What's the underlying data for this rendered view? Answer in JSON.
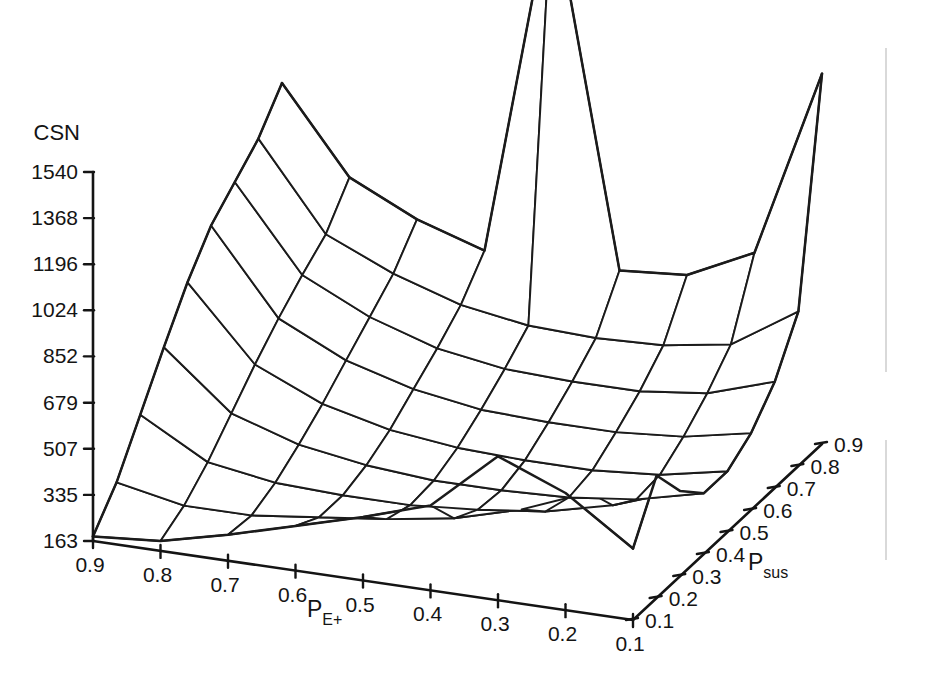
{
  "figure": {
    "kind": "3d-surface-wireframe",
    "background": "#ffffff",
    "line_color": "#1b1b1b"
  },
  "chart_data": {
    "type": "surface",
    "title": "",
    "zlabel": "CSN",
    "xlabel": "P",
    "xlabel_sub": "E+",
    "ylabel": "P",
    "ylabel_sub": "sus",
    "grid": false,
    "legend": "none",
    "x": [
      0.9,
      0.8,
      0.7,
      0.6,
      0.5,
      0.4,
      0.3,
      0.2,
      0.1
    ],
    "y": [
      0.1,
      0.2,
      0.3,
      0.4,
      0.5,
      0.6,
      0.7,
      0.8,
      0.9
    ],
    "x_tick_labels": [
      "0.9",
      "0.8",
      "0.7",
      "0.6",
      "0.5",
      "0.4",
      "0.3",
      "0.2",
      "0.1"
    ],
    "y_tick_labels": [
      "0.1",
      "0.2",
      "0.3",
      "0.4",
      "0.5",
      "0.6",
      "0.7",
      "0.8",
      "0.9"
    ],
    "z_tick_labels": [
      "163",
      "335",
      "507",
      "679",
      "852",
      "1024",
      "1196",
      "1368",
      "1540"
    ],
    "z_ticks": [
      163,
      335,
      507,
      679,
      852,
      1024,
      1196,
      1368,
      1540
    ],
    "zlim": [
      163,
      2100
    ],
    "z_axis_min": 163,
    "z_axis_max": 1540,
    "annotations": [
      "tall narrow spike near P_E+ = 0.6, P_sus = 0.9",
      "secondary spike near P_E+ = 0.3, P_sus = 0.2",
      "rising corner at P_E+ = 0.1, P_sus = 0.9",
      "rising corner at P_E+ = 0.9, P_sus = 0.9"
    ],
    "z": [
      [
        180,
        300,
        470,
        640,
        800,
        930,
        1010,
        1090,
        1215
      ],
      [
        200,
        250,
        330,
        430,
        530,
        620,
        700,
        770,
        900
      ],
      [
        260,
        250,
        290,
        350,
        420,
        500,
        580,
        660,
        780
      ],
      [
        330,
        280,
        280,
        310,
        360,
        430,
        500,
        580,
        700
      ],
      [
        400,
        310,
        280,
        290,
        330,
        390,
        460,
        540,
        2060
      ],
      [
        480,
        350,
        300,
        290,
        320,
        380,
        450,
        530,
        700
      ],
      [
        700,
        420,
        330,
        300,
        320,
        380,
        450,
        540,
        720
      ],
      [
        600,
        520,
        390,
        330,
        340,
        400,
        480,
        580,
        840
      ],
      [
        430,
        620,
        480,
        390,
        390,
        450,
        560,
        740,
        1545
      ]
    ]
  },
  "projection": {
    "origin_x": 93,
    "origin_y": 541,
    "x_axis_end_x": 633,
    "x_axis_end_y": 620,
    "y_axis_end_x": 822,
    "y_axis_end_y": 444,
    "z_top_y": 172,
    "z_bottom_y": 541
  },
  "z_axis": {
    "label": "CSN",
    "ticks": [
      {
        "label": "1540",
        "value": 1540
      },
      {
        "label": "1368",
        "value": 1368
      },
      {
        "label": "1196",
        "value": 1196
      },
      {
        "label": "1024",
        "value": 1024
      },
      {
        "label": "852",
        "value": 852
      },
      {
        "label": "679",
        "value": 679
      },
      {
        "label": "507",
        "value": 507
      },
      {
        "label": "335",
        "value": 335
      },
      {
        "label": "163",
        "value": 163
      }
    ]
  },
  "x_axis": {
    "label_main": "P",
    "label_sub": "E+",
    "ticks": [
      "0.9",
      "0.8",
      "0.7",
      "0.6",
      "0.5",
      "0.4",
      "0.3",
      "0.2",
      "0.1"
    ]
  },
  "y_axis": {
    "label_main": "P",
    "label_sub": "sus",
    "ticks": [
      "0.1",
      "0.2",
      "0.3",
      "0.4",
      "0.5",
      "0.6",
      "0.7",
      "0.8",
      "0.9"
    ]
  }
}
